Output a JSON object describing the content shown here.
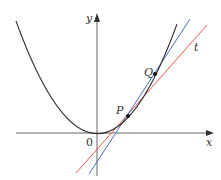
{
  "figure": {
    "labels": {
      "x_axis": "x",
      "y_axis": "y",
      "origin": "0",
      "point_p": "P",
      "point_q": "Q",
      "tangent": "t"
    },
    "colors": {
      "curve": "#333333",
      "axes": "#555555",
      "secant": "#4a6fc0",
      "tangent": "#e8574a"
    }
  }
}
